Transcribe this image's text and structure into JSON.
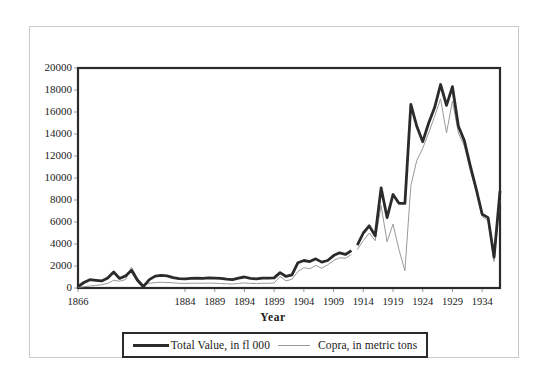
{
  "chart_data": {
    "type": "line",
    "title": "",
    "xlabel": "Year",
    "ylabel": "",
    "xlim": [
      1866,
      1937
    ],
    "ylim": [
      0,
      20000
    ],
    "grid": false,
    "legend_position": "bottom",
    "y_ticks": [
      0,
      2000,
      4000,
      6000,
      8000,
      10000,
      12000,
      14000,
      16000,
      18000,
      20000
    ],
    "y_tick_labels": [
      "0",
      "2000",
      "4000",
      "6000",
      "8000",
      "10000",
      "12000",
      "14000",
      "16000",
      "18000",
      "20000"
    ],
    "x_tick_labels": [
      "1866",
      "1884",
      "1889",
      "1894",
      "1899",
      "1904",
      "1909",
      "1914",
      "1919",
      "1924",
      "1929",
      "1934"
    ],
    "x_tick_values": [
      1866,
      1884,
      1889,
      1894,
      1899,
      1904,
      1909,
      1914,
      1919,
      1924,
      1929,
      1934
    ],
    "series": [
      {
        "name": "Total Value, in fl 000",
        "color": "#2b2b2b",
        "width": 2.8,
        "x": [
          1866,
          1867,
          1868,
          1869,
          1870,
          1871,
          1872,
          1873,
          1874,
          1875,
          1876,
          1877,
          1878,
          1879,
          1880,
          1881,
          1882,
          1883,
          1884,
          1885,
          1886,
          1887,
          1888,
          1889,
          1890,
          1891,
          1892,
          1893,
          1894,
          1895,
          1896,
          1897,
          1898,
          1899,
          1900,
          1901,
          1902,
          1903,
          1904,
          1905,
          1906,
          1907,
          1908,
          1909,
          1910,
          1911,
          1912
        ],
        "y": [
          120,
          500,
          760,
          700,
          640,
          900,
          1450,
          870,
          1100,
          1620,
          700,
          120,
          760,
          1080,
          1150,
          1100,
          950,
          860,
          830,
          870,
          900,
          880,
          920,
          900,
          870,
          800,
          760,
          900,
          1000,
          880,
          830,
          900,
          900,
          920,
          1400,
          1050,
          1200,
          2300,
          2500,
          2400,
          2650,
          2350,
          2500,
          2950,
          3200,
          3050,
          3400
        ]
      },
      {
        "name": "Total Value, in fl 000 (segment 2)",
        "color": "#2b2b2b",
        "width": 2.8,
        "x": [
          1913,
          1914,
          1915,
          1916,
          1917,
          1918,
          1919,
          1920,
          1921,
          1922,
          1923,
          1924,
          1925,
          1926,
          1927,
          1928,
          1929,
          1930,
          1931,
          1932,
          1933,
          1934,
          1935,
          1936,
          1937
        ],
        "y": [
          3900,
          5000,
          5650,
          4750,
          9100,
          6400,
          8500,
          7700,
          7700,
          16700,
          14700,
          13300,
          15000,
          16400,
          18500,
          16600,
          18300,
          14700,
          13400,
          11100,
          9000,
          6700,
          6400,
          2800,
          8800
        ]
      },
      {
        "name": "Copra, in metric tons",
        "color": "#9a9a9a",
        "width": 1.0,
        "x": [
          1866,
          1867,
          1868,
          1869,
          1870,
          1871,
          1872,
          1873,
          1874,
          1875,
          1876,
          1877,
          1878,
          1879,
          1880,
          1881,
          1882,
          1883,
          1884,
          1885,
          1886,
          1887,
          1888,
          1889,
          1890,
          1891,
          1892,
          1893,
          1894,
          1895,
          1896,
          1897,
          1898,
          1899,
          1900,
          1901,
          1902,
          1903,
          1904,
          1905,
          1906,
          1907,
          1908,
          1909,
          1910,
          1911,
          1912
        ],
        "y": [
          60,
          120,
          180,
          240,
          300,
          420,
          700,
          620,
          760,
          1900,
          900,
          300,
          420,
          500,
          520,
          500,
          470,
          430,
          420,
          430,
          440,
          430,
          450,
          430,
          400,
          380,
          360,
          420,
          460,
          420,
          400,
          430,
          430,
          450,
          1050,
          640,
          800,
          1500,
          1850,
          1750,
          2050,
          1800,
          2100,
          2500,
          2750,
          2700,
          3050
        ]
      },
      {
        "name": "Copra, in metric tons (segment 2)",
        "color": "#9a9a9a",
        "width": 1.0,
        "x": [
          1913,
          1914,
          1915,
          1916,
          1917,
          1918,
          1919,
          1920,
          1921,
          1922,
          1923,
          1924,
          1925,
          1926,
          1927,
          1928,
          1929,
          1930,
          1931,
          1932,
          1933,
          1934,
          1935,
          1936,
          1937
        ],
        "y": [
          3500,
          4300,
          5000,
          4300,
          7500,
          4200,
          5800,
          3500,
          1550,
          9300,
          11600,
          12700,
          14100,
          15600,
          17200,
          14100,
          17000,
          14100,
          12900,
          10700,
          8700,
          6500,
          6100,
          2400,
          8000
        ]
      }
    ]
  },
  "legend": {
    "entries": [
      {
        "label": "Total Value, in fl 000",
        "style": "thick"
      },
      {
        "label": "Copra, in metric tons",
        "style": "thin"
      }
    ]
  },
  "axis": {
    "x_title": "Year"
  },
  "colors": {
    "total_value_line": "#2b2b2b",
    "copra_line": "#9a9a9a",
    "frame": "#2b2b2b",
    "outer_frame": "#c9c9c9",
    "background": "#ffffff"
  }
}
